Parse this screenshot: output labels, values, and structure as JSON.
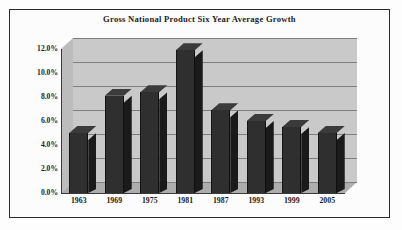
{
  "chart_data": {
    "type": "bar",
    "title": "Gross National Product Six Year Average Growth",
    "xlabel": "",
    "ylabel": "",
    "categories": [
      "1963",
      "1969",
      "1975",
      "1981",
      "1987",
      "1993",
      "1999",
      "2005"
    ],
    "values": [
      5.0,
      8.1,
      8.4,
      11.9,
      6.9,
      6.0,
      5.5,
      5.0
    ],
    "ylim": [
      0,
      12
    ],
    "ytick_values": [
      0,
      2,
      4,
      6,
      8,
      10,
      12
    ],
    "ytick_labels": [
      "0.0%",
      "2.0%",
      "4.0%",
      "6.0%",
      "8.0%",
      "10.0%",
      "12.0%"
    ],
    "grid": true,
    "legend": "none",
    "style": "3d-column",
    "series": [
      {
        "name": "Six Year Average Growth",
        "values": [
          5.0,
          8.1,
          8.4,
          11.9,
          6.9,
          6.0,
          5.5,
          5.0
        ]
      }
    ]
  },
  "colors": {
    "page_background": "#ffffff",
    "border": "#2a2a2a",
    "plot_background": "#c9c9c9",
    "plot_side_wall": "#bcbcbc",
    "plot_floor": "#adadad",
    "gridline": "#7e7e7e",
    "bar_front": "#2f2f2f",
    "bar_side": "#1a1a1a",
    "bar_top": "#3b3b3b",
    "text": "#1a1a1a"
  }
}
